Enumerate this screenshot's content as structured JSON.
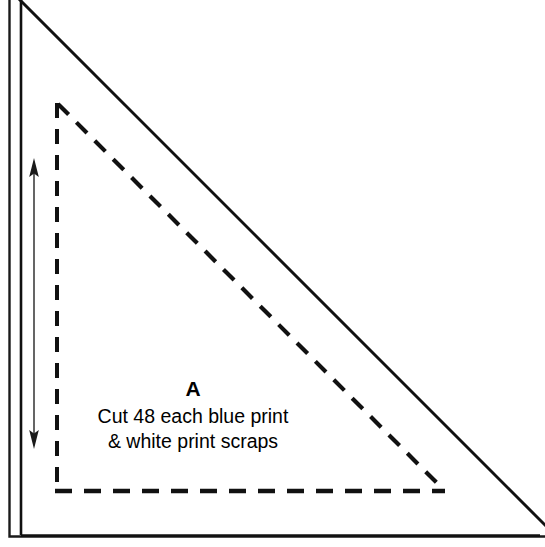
{
  "diagram": {
    "type": "quilt-pattern-template",
    "piece_letter": "A",
    "cut_instructions": {
      "line_1": "Cut 48 each blue print",
      "line_2": "& white print scraps"
    },
    "quantity": 48,
    "fabrics": [
      "blue print",
      "white print scraps"
    ],
    "shapes": {
      "outer_frame": {
        "name": "outer-border-frame",
        "stroke": "#1a1a1a",
        "stroke_width": 2.5,
        "x": 9,
        "y": 1,
        "width": 527,
        "height": 536,
        "sides_drawn": "left-and-bottom"
      },
      "cutting_triangle": {
        "name": "solid-cutting-line-triangle",
        "style": "solid",
        "stroke": "#111111",
        "stroke_width": 2.8,
        "points": "21,2 21,536 538,536"
      },
      "seam_triangle": {
        "name": "dashed-seam-line-triangle",
        "style": "dashed",
        "stroke": "#111111",
        "stroke_width": 4,
        "dash_pattern": "15 11",
        "points": "57,105 57,491 443,491"
      },
      "measure_arrow": {
        "name": "height-measure-arrow",
        "stroke": "#3a3a3a",
        "stroke_width": 1.6,
        "x": 34,
        "y_top": 161,
        "y_bottom": 446,
        "double_headed": true
      }
    },
    "colors": {
      "background": "#ffffff",
      "line": "#111111",
      "frame": "#1a1a1a",
      "arrow": "#3a3a3a",
      "text": "#000000"
    }
  }
}
